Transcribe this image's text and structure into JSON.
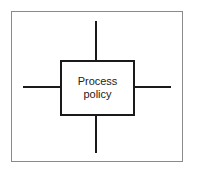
{
  "diagram": {
    "title": "",
    "center_node": {
      "label": "Process\npolicy"
    },
    "connectors": [
      {
        "direction": "top"
      },
      {
        "direction": "bottom"
      },
      {
        "direction": "left"
      },
      {
        "direction": "right"
      }
    ],
    "colors": {
      "line": "#1a1a1a",
      "frame": "#8a8a8a",
      "background": "#ffffff"
    }
  }
}
